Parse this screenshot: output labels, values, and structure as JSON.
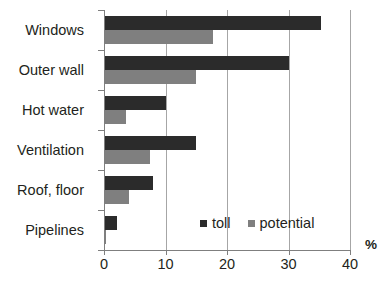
{
  "chart_data": {
    "type": "bar",
    "orientation": "horizontal",
    "title": "",
    "xlabel": "%",
    "ylabel": "",
    "xlim": [
      0,
      40
    ],
    "xticks": [
      0,
      10,
      20,
      30,
      40
    ],
    "grid": "vertical gridlines at 10, 20, 30, 40",
    "legend_position": "inside lower right",
    "categories": [
      "Windows",
      "Outer wall",
      "Hot water",
      "Ventilation",
      "Roof, floor",
      "Pipelines"
    ],
    "series": [
      {
        "name": "toll",
        "color": "#2b2b2b",
        "values": [
          35.3,
          30.0,
          10.0,
          15.0,
          8.0,
          2.1
        ]
      },
      {
        "name": "potential",
        "color": "#7f7f7f",
        "values": [
          17.7,
          15.0,
          3.5,
          7.5,
          4.0,
          0.3
        ]
      }
    ]
  },
  "axis": {
    "tick_labels": [
      "0",
      "10",
      "20",
      "30",
      "40"
    ],
    "unit": "%"
  },
  "legend": {
    "items": [
      {
        "label": "toll",
        "color": "#2b2b2b"
      },
      {
        "label": "potential",
        "color": "#7f7f7f"
      }
    ]
  },
  "colors": {
    "toll": "#2b2b2b",
    "potential": "#7f7f7f",
    "gridline": "#a6a6a6",
    "axis": "#7f7f7f",
    "text": "#231f20",
    "background": "#ffffff"
  }
}
